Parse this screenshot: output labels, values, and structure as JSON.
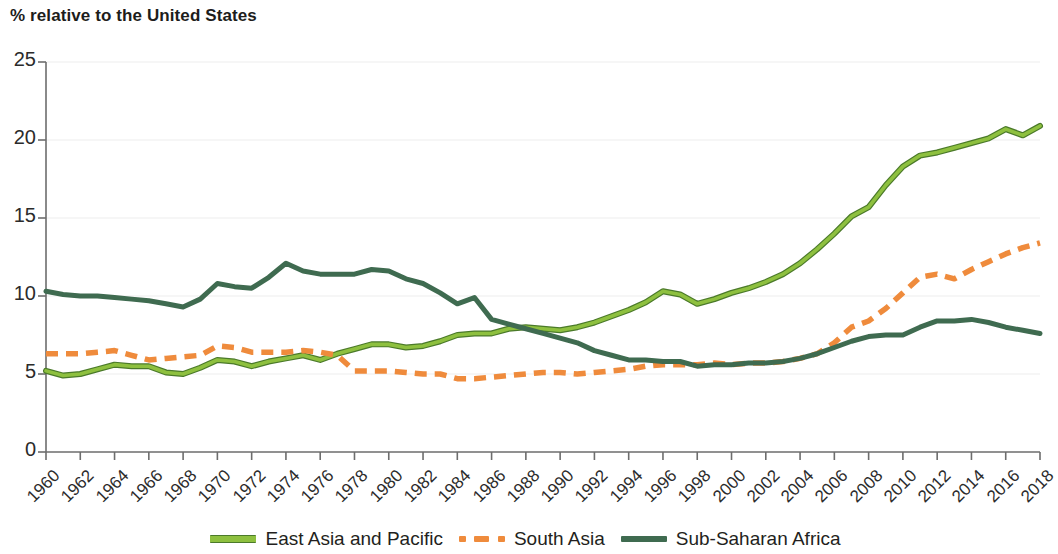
{
  "chart_data": {
    "type": "line",
    "title": "% relative to the United States",
    "xlabel": "",
    "ylabel": "",
    "ylim": [
      0,
      25
    ],
    "xlim": [
      1960,
      2018
    ],
    "yticks": [
      "0",
      "5",
      "10",
      "15",
      "20",
      "25"
    ],
    "ytick_values": [
      0,
      5,
      10,
      15,
      20,
      25
    ],
    "grid": "horizontal",
    "legend_position": "bottom",
    "x": [
      1960,
      1961,
      1962,
      1963,
      1964,
      1965,
      1966,
      1967,
      1968,
      1969,
      1970,
      1971,
      1972,
      1973,
      1974,
      1975,
      1976,
      1977,
      1978,
      1979,
      1980,
      1981,
      1982,
      1983,
      1984,
      1985,
      1986,
      1987,
      1988,
      1989,
      1990,
      1991,
      1992,
      1993,
      1994,
      1995,
      1996,
      1997,
      1998,
      1999,
      2000,
      2001,
      2002,
      2003,
      2004,
      2005,
      2006,
      2007,
      2008,
      2009,
      2010,
      2011,
      2012,
      2013,
      2014,
      2015,
      2016,
      2017,
      2018
    ],
    "xtick_labels": [
      "1960",
      "1962",
      "1964",
      "1966",
      "1968",
      "1970",
      "1972",
      "1974",
      "1976",
      "1978",
      "1980",
      "1982",
      "1984",
      "1986",
      "1988",
      "1990",
      "1992",
      "1994",
      "1996",
      "1998",
      "2000",
      "2002",
      "2004",
      "2006",
      "2008",
      "2010",
      "2012",
      "2014",
      "2016",
      "2018"
    ],
    "series": [
      {
        "name": "East Asia and Pacific",
        "color": "#8ec03f",
        "edge_color": "#4b7a2a",
        "style": "solid",
        "values": [
          5.2,
          4.9,
          5.0,
          5.3,
          5.6,
          5.5,
          5.5,
          5.1,
          5.0,
          5.4,
          5.9,
          5.8,
          5.5,
          5.8,
          6.0,
          6.2,
          5.9,
          6.3,
          6.6,
          6.9,
          6.9,
          6.7,
          6.8,
          7.1,
          7.5,
          7.6,
          7.6,
          7.9,
          8.0,
          7.9,
          7.8,
          8.0,
          8.3,
          8.7,
          9.1,
          9.6,
          10.3,
          10.1,
          9.5,
          9.8,
          10.2,
          10.5,
          10.9,
          11.4,
          12.1,
          13.0,
          14.0,
          15.1,
          15.7,
          17.1,
          18.3,
          19.0,
          19.2,
          19.5,
          19.8,
          20.1,
          20.7,
          20.3,
          20.9
        ]
      },
      {
        "name": "South Asia",
        "color": "#ef8b3c",
        "edge_color": "#ef8b3c",
        "style": "dashed",
        "values": [
          6.3,
          6.3,
          6.3,
          6.4,
          6.5,
          6.2,
          5.9,
          6.0,
          6.1,
          6.2,
          6.8,
          6.7,
          6.4,
          6.4,
          6.4,
          6.5,
          6.4,
          6.2,
          5.2,
          5.2,
          5.2,
          5.1,
          5.0,
          5.0,
          4.7,
          4.7,
          4.8,
          4.9,
          5.0,
          5.1,
          5.1,
          5.0,
          5.1,
          5.2,
          5.3,
          5.5,
          5.6,
          5.6,
          5.6,
          5.7,
          5.6,
          5.7,
          5.7,
          5.8,
          6.0,
          6.3,
          7.0,
          8.0,
          8.4,
          9.2,
          10.2,
          11.2,
          11.4,
          11.1,
          11.7,
          12.2,
          12.7,
          13.1,
          13.4
        ]
      },
      {
        "name": "Sub-Saharan Africa",
        "color": "#3f6b50",
        "edge_color": "#3f6b50",
        "style": "solid",
        "values": [
          10.3,
          10.1,
          10.0,
          10.0,
          9.9,
          9.8,
          9.7,
          9.5,
          9.3,
          9.8,
          10.8,
          10.6,
          10.5,
          11.2,
          12.1,
          11.6,
          11.4,
          11.4,
          11.4,
          11.7,
          11.6,
          11.1,
          10.8,
          10.2,
          9.5,
          9.9,
          8.5,
          8.2,
          7.9,
          7.6,
          7.3,
          7.0,
          6.5,
          6.2,
          5.9,
          5.9,
          5.8,
          5.8,
          5.5,
          5.6,
          5.6,
          5.7,
          5.7,
          5.8,
          6.0,
          6.3,
          6.7,
          7.1,
          7.4,
          7.5,
          7.5,
          8.0,
          8.4,
          8.4,
          8.5,
          8.3,
          8.0,
          7.8,
          7.6
        ]
      }
    ]
  },
  "legend": [
    {
      "label": "East Asia and Pacific",
      "icon": "line-swatch-solid"
    },
    {
      "label": "South Asia",
      "icon": "line-swatch-dashed"
    },
    {
      "label": "Sub-Saharan Africa",
      "icon": "line-swatch-solid"
    }
  ]
}
